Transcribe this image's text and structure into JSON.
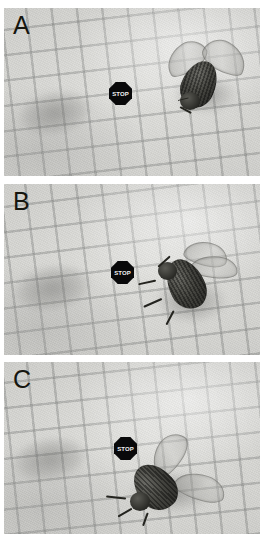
{
  "figure": {
    "name": "fly-size-comparison-figure",
    "background_color": "#ffffff",
    "panel_count": 3,
    "description_visible_text": ""
  },
  "panels": [
    {
      "id": "A",
      "label": "A",
      "marker": {
        "type": "stop-sign",
        "shape": "octagon",
        "text": "STOP",
        "fill_color": "#09090a",
        "text_color": "#f2f2f2"
      },
      "subject": {
        "name": "fly",
        "pose": "wings-spread-upward",
        "position": "upper-right"
      },
      "background": {
        "surface": "graph-paper",
        "grid_color": "#767a76",
        "paper_color": "#dcdcd8",
        "grid_rotation_deg": -6.5
      }
    },
    {
      "id": "B",
      "label": "B",
      "marker": {
        "type": "stop-sign",
        "shape": "octagon",
        "text": "STOP",
        "fill_color": "#09090a",
        "text_color": "#f2f2f2"
      },
      "subject": {
        "name": "fly",
        "pose": "wings-folded-legs-extended",
        "position": "right-of-center"
      },
      "background": {
        "surface": "graph-paper",
        "grid_color": "#767a76",
        "paper_color": "#dcdcd8",
        "grid_rotation_deg": -6.5
      }
    },
    {
      "id": "C",
      "label": "C",
      "marker": {
        "type": "stop-sign",
        "shape": "octagon",
        "text": "STOP",
        "fill_color": "#09090a",
        "text_color": "#f2f2f2"
      },
      "subject": {
        "name": "fly",
        "pose": "wings-spread-wide",
        "position": "lower-center-right"
      },
      "background": {
        "surface": "graph-paper",
        "grid_color": "#767a76",
        "paper_color": "#dcdcd8",
        "grid_rotation_deg": -6.5
      }
    }
  ]
}
